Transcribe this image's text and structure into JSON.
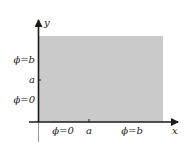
{
  "diagram": {
    "colors": {
      "region_fill": "#cacaca",
      "axis": "#1a1a1a",
      "text": "#222222",
      "background": "#ffffff"
    },
    "axes": {
      "x_label": "x",
      "y_label": "y"
    },
    "x_axis_labels": [
      {
        "text": "ϕ=0",
        "x": 63
      },
      {
        "text": "a",
        "x": 89
      },
      {
        "text": "ϕ=b",
        "x": 132
      }
    ],
    "y_axis_labels": [
      {
        "text": "ϕ=b",
        "y": 62
      },
      {
        "text": "a",
        "y": 82
      },
      {
        "text": "ϕ=0",
        "y": 102
      }
    ],
    "ticks": {
      "x_tick_label": "a",
      "y_tick_label": "a"
    }
  }
}
